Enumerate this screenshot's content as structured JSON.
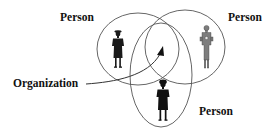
{
  "diagram": {
    "type": "venn-relationship",
    "labels": {
      "person_top_left": "Person",
      "person_top_right": "Person",
      "person_bottom": "Person",
      "organization": "Organization"
    },
    "circles": [
      {
        "id": "person-left",
        "cx": 138,
        "cy": 49,
        "rx": 41,
        "ry": 36
      },
      {
        "id": "person-right",
        "cx": 185,
        "cy": 47,
        "rx": 40,
        "ry": 37
      },
      {
        "id": "person-bottom",
        "cx": 161,
        "cy": 75,
        "rx": 31,
        "ry": 52
      }
    ],
    "arrow": {
      "from_label": "Organization",
      "to": "overlap-center"
    },
    "colors": {
      "stroke": "#555555",
      "figure_dark": "#1a1a1a",
      "figure_light": "#8a8a8a",
      "text": "#111111"
    }
  }
}
